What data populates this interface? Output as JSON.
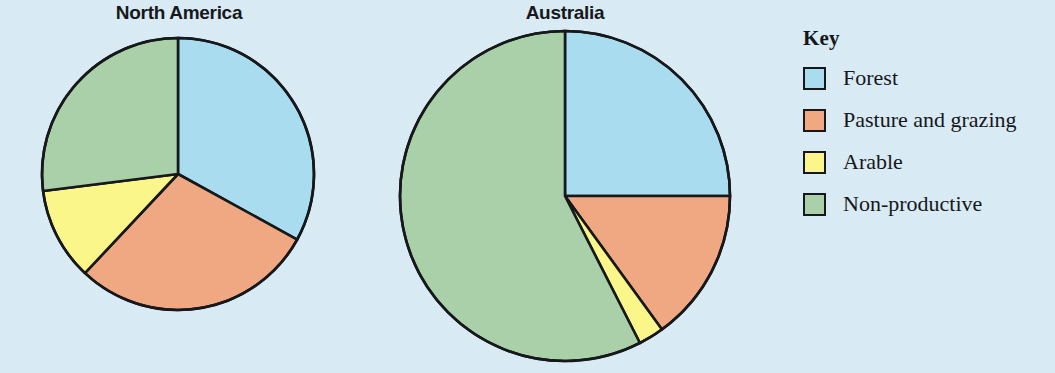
{
  "page": {
    "background_color": "#d8eaf4"
  },
  "legend": {
    "title": "Key",
    "items": [
      {
        "label": "Forest",
        "color": "#aadcef",
        "swatch_name": "legend-swatch-forest"
      },
      {
        "label": "Pasture and grazing",
        "color": "#f0a882",
        "swatch_name": "legend-swatch-pasture"
      },
      {
        "label": "Arable",
        "color": "#faf68a",
        "swatch_name": "legend-swatch-arable"
      },
      {
        "label": "Non-productive",
        "color": "#a9d0a8",
        "swatch_name": "legend-swatch-nonproductive"
      }
    ]
  },
  "chart_data": [
    {
      "type": "pie",
      "title": "North America",
      "categories": [
        "Forest",
        "Pasture and grazing",
        "Arable",
        "Non-productive"
      ],
      "values": [
        33,
        29,
        11,
        27
      ],
      "colors": [
        "#aadcef",
        "#f0a882",
        "#faf68a",
        "#a9d0a8"
      ],
      "start_angle_deg": 0,
      "direction": "clockwise",
      "legend_position": "right",
      "grid": false,
      "xlabel": "",
      "ylabel": ""
    },
    {
      "type": "pie",
      "title": "Australia",
      "categories": [
        "Forest",
        "Pasture and grazing",
        "Arable",
        "Non-productive"
      ],
      "values": [
        25,
        15,
        2.5,
        57.5
      ],
      "colors": [
        "#aadcef",
        "#f0a882",
        "#faf68a",
        "#a9d0a8"
      ],
      "start_angle_deg": 0,
      "direction": "clockwise",
      "legend_position": "right",
      "grid": false,
      "xlabel": "",
      "ylabel": ""
    }
  ]
}
